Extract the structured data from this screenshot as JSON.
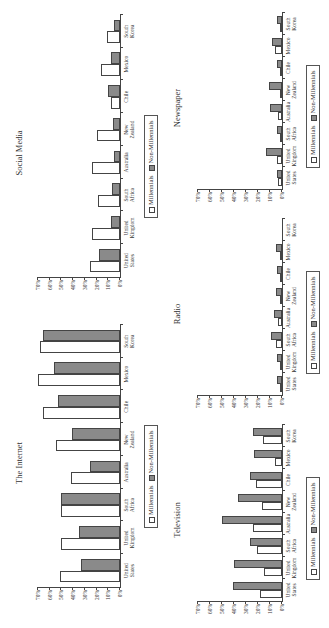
{
  "legend": {
    "millennials": "Millennials",
    "non_millennials": "Non-Millennials"
  },
  "colors": {
    "millennials": "#ffffff",
    "non_millennials": "#8a8a8a",
    "axis": "#444444"
  },
  "categories_display": [
    "United\nStates",
    "United\nKingdom",
    "South\nAfrica",
    "Australia",
    "New\nZealand",
    "Chile",
    "Mexico",
    "South\nKorea"
  ],
  "yticks": [
    "0%",
    "10%",
    "20%",
    "30%",
    "40%",
    "50%",
    "60%",
    "70%"
  ],
  "chart_data": [
    {
      "type": "bar",
      "title": "The Internet",
      "categories": [
        "United States",
        "United Kingdom",
        "South Africa",
        "Australia",
        "New Zealand",
        "Chile",
        "Mexico",
        "South Korea"
      ],
      "series": [
        {
          "name": "Millennials",
          "values": [
            51,
            50,
            50,
            42,
            55,
            66,
            70,
            68
          ]
        },
        {
          "name": "Non-Millennials",
          "values": [
            33,
            35,
            50,
            26,
            41,
            53,
            56,
            66
          ]
        }
      ],
      "xlabel": "",
      "ylabel": "",
      "ylim": [
        0,
        70
      ],
      "yticks": [
        "0%",
        "10%",
        "20%",
        "30%",
        "40%",
        "50%",
        "60%",
        "70%"
      ],
      "grid": false,
      "legend_position": "bottom"
    },
    {
      "type": "bar",
      "title": "Social Media",
      "categories": [
        "United States",
        "United Kingdom",
        "South Africa",
        "Australia",
        "New Zealand",
        "Chile",
        "Mexico",
        "South Korea"
      ],
      "series": [
        {
          "name": "Millennials",
          "values": [
            26,
            24,
            19,
            24,
            20,
            8,
            16,
            11
          ]
        },
        {
          "name": "Non-Millennials",
          "values": [
            18,
            8,
            7,
            5,
            6,
            10,
            8,
            5
          ]
        }
      ],
      "xlabel": "",
      "ylabel": "",
      "ylim": [
        0,
        70
      ],
      "yticks": [
        "0%",
        "10%",
        "20%",
        "30%",
        "40%",
        "50%",
        "60%",
        "70%"
      ],
      "grid": false,
      "legend_position": "bottom"
    },
    {
      "type": "bar",
      "title": "Television",
      "categories": [
        "United States",
        "United Kingdom",
        "South Africa",
        "Australia",
        "New Zealand",
        "Chile",
        "Mexico",
        "South Korea"
      ],
      "series": [
        {
          "name": "Millennials",
          "values": [
            18,
            15,
            21,
            24,
            17,
            22,
            6,
            16
          ]
        },
        {
          "name": "Non-Millennials",
          "values": [
            41,
            40,
            27,
            50,
            37,
            27,
            23,
            24
          ]
        }
      ],
      "xlabel": "",
      "ylabel": "",
      "ylim": [
        0,
        70
      ],
      "yticks": [
        "0%",
        "10%",
        "20%",
        "30%",
        "40%",
        "50%",
        "60%",
        "70%"
      ],
      "grid": false,
      "legend_position": "bottom"
    },
    {
      "type": "bar",
      "title": "Radio",
      "categories": [
        "United States",
        "United Kingdom",
        "South Africa",
        "Australia",
        "New Zealand",
        "Chile",
        "Mexico",
        "South Korea"
      ],
      "series": [
        {
          "name": "Millennials",
          "values": [
            1,
            2,
            5,
            3,
            2,
            1,
            1,
            0
          ]
        },
        {
          "name": "Non-Millennials",
          "values": [
            4,
            4,
            9,
            7,
            5,
            4,
            5,
            0
          ]
        }
      ],
      "xlabel": "",
      "ylabel": "",
      "ylim": [
        0,
        70
      ],
      "yticks": [
        "0%",
        "10%",
        "20%",
        "30%",
        "40%",
        "50%",
        "60%",
        "70%"
      ],
      "grid": false,
      "legend_position": "bottom"
    },
    {
      "type": "bar",
      "title": "Newspaper",
      "categories": [
        "United States",
        "United Kingdom",
        "South Africa",
        "Australia",
        "New Zealand",
        "Chile",
        "Mexico",
        "South Korea"
      ],
      "series": [
        {
          "name": "Millennials",
          "values": [
            3,
            4,
            2,
            3,
            2,
            2,
            6,
            1
          ]
        },
        {
          "name": "Non-Millennials",
          "values": [
            4,
            13,
            4,
            10,
            11,
            4,
            8,
            4
          ]
        }
      ],
      "xlabel": "",
      "ylabel": "",
      "ylim": [
        0,
        70
      ],
      "yticks": [
        "0%",
        "10%",
        "20%",
        "30%",
        "40%",
        "50%",
        "60%",
        "70%"
      ],
      "grid": false,
      "legend_position": "bottom"
    }
  ]
}
